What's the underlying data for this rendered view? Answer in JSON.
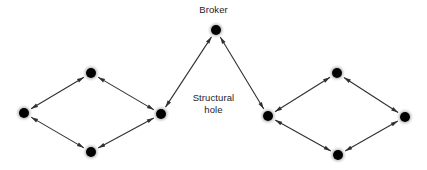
{
  "canvas": {
    "width": 427,
    "height": 170,
    "background": "#ffffff"
  },
  "labels": {
    "broker": "Broker",
    "structural_hole": "Structural\nhole"
  },
  "style": {
    "node_color": "#000000",
    "node_halo_color": "#9a9a9a",
    "edge_color": "#303030",
    "text_color": "#1c1c1c",
    "node_radius": 5.0,
    "node_halo_radius": 8.0,
    "edge_width": 1.1,
    "arrow_length": 7,
    "arrow_width": 4
  },
  "chart_data": {
    "type": "diagram",
    "subtype": "network-graph",
    "directed": "bidirectional",
    "nodes": [
      {
        "id": "broker",
        "label": "Broker",
        "x": 216,
        "y": 30,
        "role": "broker"
      },
      {
        "id": "left_outer",
        "label": "",
        "x": 24,
        "y": 113,
        "role": "peripheral"
      },
      {
        "id": "left_top",
        "label": "",
        "x": 91,
        "y": 73,
        "role": "peripheral"
      },
      {
        "id": "left_bottom",
        "label": "",
        "x": 91,
        "y": 152,
        "role": "peripheral"
      },
      {
        "id": "left_hub",
        "label": "",
        "x": 161,
        "y": 114,
        "role": "cluster-hub"
      },
      {
        "id": "right_hub",
        "label": "",
        "x": 268,
        "y": 116,
        "role": "cluster-hub"
      },
      {
        "id": "right_top",
        "label": "",
        "x": 337,
        "y": 73,
        "role": "peripheral"
      },
      {
        "id": "right_bottom",
        "label": "",
        "x": 338,
        "y": 155,
        "role": "peripheral"
      },
      {
        "id": "right_outer",
        "label": "",
        "x": 405,
        "y": 117,
        "role": "peripheral"
      }
    ],
    "edges": [
      {
        "source": "left_outer",
        "target": "left_top",
        "arrows": "both"
      },
      {
        "source": "left_top",
        "target": "left_hub",
        "arrows": "both"
      },
      {
        "source": "left_outer",
        "target": "left_bottom",
        "arrows": "both"
      },
      {
        "source": "left_bottom",
        "target": "left_hub",
        "arrows": "both"
      },
      {
        "source": "left_hub",
        "target": "broker",
        "arrows": "both"
      },
      {
        "source": "broker",
        "target": "right_hub",
        "arrows": "both"
      },
      {
        "source": "right_hub",
        "target": "right_top",
        "arrows": "both"
      },
      {
        "source": "right_top",
        "target": "right_outer",
        "arrows": "both"
      },
      {
        "source": "right_hub",
        "target": "right_bottom",
        "arrows": "both"
      },
      {
        "source": "right_bottom",
        "target": "right_outer",
        "arrows": "both"
      }
    ],
    "annotations": [
      {
        "id": "broker-label",
        "text": "Broker",
        "x": 216,
        "y": 10,
        "anchor": "middle"
      },
      {
        "id": "structural-hole-label",
        "text": "Structural\nhole",
        "x": 216,
        "y": 104,
        "anchor": "middle"
      }
    ],
    "xlabel": "",
    "ylabel": "",
    "legend": []
  }
}
